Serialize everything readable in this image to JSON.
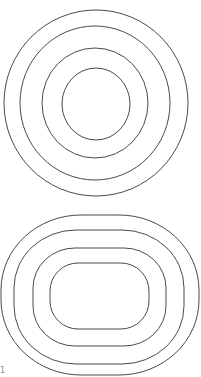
{
  "diagram": {
    "stroke_color": "#4a4a4a",
    "background": "#ffffff",
    "top_figure": {
      "shape": "concentric-circles",
      "rings": [
        {
          "cx": 96,
          "cy": 103,
          "rx": 92,
          "ry": 93
        },
        {
          "cx": 95,
          "cy": 103,
          "rx": 75,
          "ry": 77
        },
        {
          "cx": 95,
          "cy": 103,
          "rx": 53,
          "ry": 55
        },
        {
          "cx": 96,
          "cy": 104,
          "rx": 34,
          "ry": 36
        }
      ]
    },
    "bottom_figure": {
      "shape": "concentric-rounded-rectangles",
      "rings": [
        {
          "x": 1,
          "y": 215,
          "w": 198,
          "h": 160,
          "r": 75
        },
        {
          "x": 14,
          "y": 230,
          "w": 170,
          "h": 134,
          "r": 60
        },
        {
          "x": 33,
          "y": 248,
          "w": 133,
          "h": 98,
          "r": 42
        },
        {
          "x": 50,
          "y": 263,
          "w": 99,
          "h": 66,
          "r": 28
        }
      ]
    },
    "corner_label": "1"
  }
}
